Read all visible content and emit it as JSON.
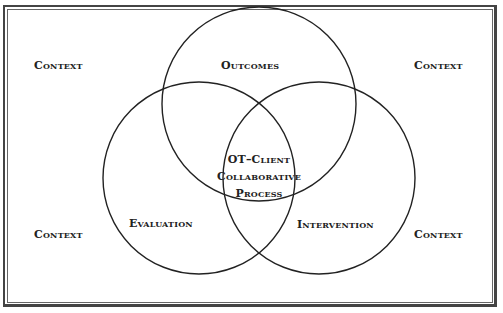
{
  "diagram": {
    "type": "venn",
    "frame": "double-border",
    "circles": [
      {
        "id": "outcomes",
        "label": "Outcomes",
        "cx": 259,
        "cy": 104,
        "r": 97
      },
      {
        "id": "evaluation",
        "label": "Evaluation",
        "cx": 199,
        "cy": 178,
        "r": 96
      },
      {
        "id": "intervention",
        "label": "Intervention",
        "cx": 319,
        "cy": 178,
        "r": 96
      }
    ],
    "center_label": [
      "OT–Client",
      "Collaborative",
      "Process"
    ],
    "context_labels": {
      "top_left": "Context",
      "top_right": "Context",
      "bottom_left": "Context",
      "bottom_right": "Context"
    },
    "line_color": "#222222"
  }
}
